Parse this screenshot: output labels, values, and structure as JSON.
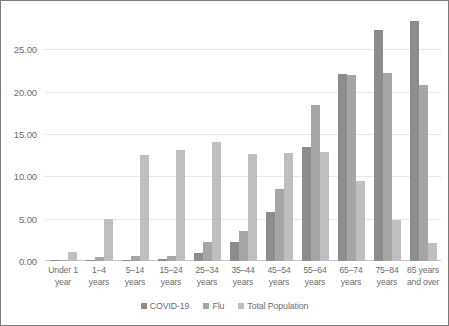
{
  "chart_data": {
    "type": "bar",
    "title": "",
    "subtitle": "",
    "xlabel": "",
    "ylabel": "",
    "ylim": [
      0,
      29.5
    ],
    "yticks": [
      0,
      5,
      10,
      15,
      20,
      25
    ],
    "ytick_labels": [
      "0.00",
      "5.00",
      "10.00",
      "15.00",
      "20.00",
      "25.00"
    ],
    "grid": true,
    "legend_position": "bottom",
    "categories": [
      "Under 1 year",
      "1–4 years",
      "5–14 years",
      "15–24 years",
      "25–34 years",
      "35–44 years",
      "45–54 years",
      "55–64 years",
      "65–74 years",
      "75–84 years",
      "85 years and over"
    ],
    "category_lines": [
      [
        "Under 1",
        "year"
      ],
      [
        "1–4",
        "years"
      ],
      [
        "5–14",
        "years"
      ],
      [
        "15–24",
        "years"
      ],
      [
        "25–34",
        "years"
      ],
      [
        "35–44",
        "years"
      ],
      [
        "45–54",
        "years"
      ],
      [
        "55–64",
        "years"
      ],
      [
        "65–74",
        "years"
      ],
      [
        "75–84",
        "years"
      ],
      [
        "85 years",
        "and over"
      ]
    ],
    "series": [
      {
        "name": "COVID-19",
        "color": "#8c8c8c",
        "values": [
          0.05,
          0.05,
          0.1,
          0.2,
          0.9,
          2.2,
          5.8,
          13.5,
          22.1,
          27.3,
          28.3
        ]
      },
      {
        "name": "Flu",
        "color": "#a6a6a6",
        "values": [
          0.1,
          0.5,
          0.6,
          0.6,
          2.3,
          3.6,
          8.5,
          18.4,
          21.9,
          22.2,
          20.8
        ]
      },
      {
        "name": "Total Population",
        "color": "#bfbfbf",
        "values": [
          1.1,
          4.9,
          12.5,
          13.1,
          14.0,
          12.6,
          12.8,
          12.9,
          9.4,
          4.8,
          2.1
        ]
      }
    ]
  },
  "legend": {
    "items": [
      {
        "label": "COVID-19",
        "color": "#8c8c8c"
      },
      {
        "label": "Flu",
        "color": "#a6a6a6"
      },
      {
        "label": "Total Population",
        "color": "#bfbfbf"
      }
    ]
  },
  "colors": {
    "frame_border": "#7a7a7a",
    "gridline": "#e6e6e6",
    "axis_text": "#6d6d6d",
    "background": "#ffffff"
  }
}
